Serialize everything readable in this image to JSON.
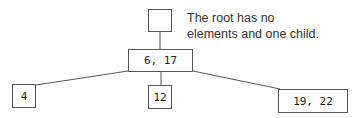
{
  "diagram": {
    "type": "tree",
    "caption": {
      "line1": "The root has no",
      "line2": "elements and one child."
    },
    "nodes": [
      {
        "id": "root",
        "label": "",
        "x": 148,
        "y": 9,
        "w": 24,
        "h": 23
      },
      {
        "id": "mid",
        "label": "6, 17",
        "x": 128,
        "y": 49,
        "w": 65,
        "h": 23
      },
      {
        "id": "left",
        "label": "4",
        "x": 12,
        "y": 84,
        "w": 24,
        "h": 24
      },
      {
        "id": "center",
        "label": "12",
        "x": 148,
        "y": 85,
        "w": 24,
        "h": 24
      },
      {
        "id": "right",
        "label": "19, 22",
        "x": 278,
        "y": 89,
        "w": 70,
        "h": 24
      }
    ],
    "edges": [
      {
        "from": "root",
        "to": "mid"
      },
      {
        "from": "mid",
        "to": "left"
      },
      {
        "from": "mid",
        "to": "center"
      },
      {
        "from": "mid",
        "to": "right"
      }
    ]
  }
}
